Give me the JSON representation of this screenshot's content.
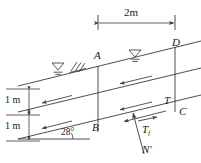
{
  "figure": {
    "type": "engineering-diagram",
    "background": "#ffffff",
    "line_color": "#3a3a3a"
  },
  "dimensions": {
    "top_span": "2m",
    "layer_upper": "1 m",
    "layer_lower": "1 m"
  },
  "angle": {
    "value": "28°"
  },
  "points": {
    "a": "A",
    "b": "B",
    "c": "C",
    "d": "D"
  },
  "forces": {
    "tangential": "T",
    "friction_base": "T",
    "friction_sub": "f",
    "normal": "N'"
  },
  "symbols": {
    "water_table_upper": "water-table-symbol",
    "water_table_lower": "water-table-symbol",
    "hatching": "ground-hatching",
    "flow_arrow": "seepage-flow-arrow"
  },
  "flow_arrows_count": 6
}
